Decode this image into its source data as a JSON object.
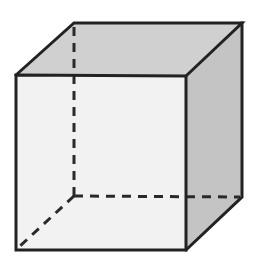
{
  "diagram": {
    "type": "cube-wireframe",
    "colors": {
      "background": "#ffffff",
      "front_face": "#f2f2f2",
      "top_face": "#d0d0d0",
      "right_face": "#c4c4c4",
      "edge": "#222222",
      "hidden_edge": "#2a2a2a"
    },
    "vertices": {
      "front_top_left": [
        16,
        75
      ],
      "front_top_right": [
        186,
        76
      ],
      "front_bottom_right": [
        186,
        250
      ],
      "front_bottom_left": [
        16,
        250
      ],
      "back_top_left": [
        74,
        23
      ],
      "back_top_right": [
        242,
        23
      ],
      "back_bottom_right": [
        242,
        197
      ],
      "back_bottom_left": [
        74,
        196
      ]
    },
    "visible_edges": 9,
    "hidden_edges": 3
  }
}
